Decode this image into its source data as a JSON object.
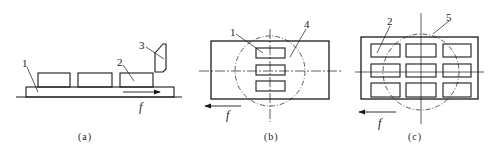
{
  "figure": {
    "panels": [
      {
        "id": "a",
        "caption": "(a)",
        "view": "side",
        "callouts": [
          "1",
          "2",
          "3"
        ],
        "feed_label": "f",
        "feed_direction": "right",
        "workpiece_count": 3
      },
      {
        "id": "b",
        "caption": "(b)",
        "view": "top",
        "callouts": [
          "1",
          "4"
        ],
        "feed_label": "f",
        "feed_direction": "left",
        "workpiece_grid": "1x3"
      },
      {
        "id": "c",
        "caption": "(c)",
        "view": "top",
        "callouts": [
          "2",
          "5"
        ],
        "feed_label": "f",
        "feed_direction": "left",
        "workpiece_grid": "3x3"
      }
    ],
    "colors": {
      "line": "#1a1a1a",
      "background": "#ffffff"
    }
  }
}
